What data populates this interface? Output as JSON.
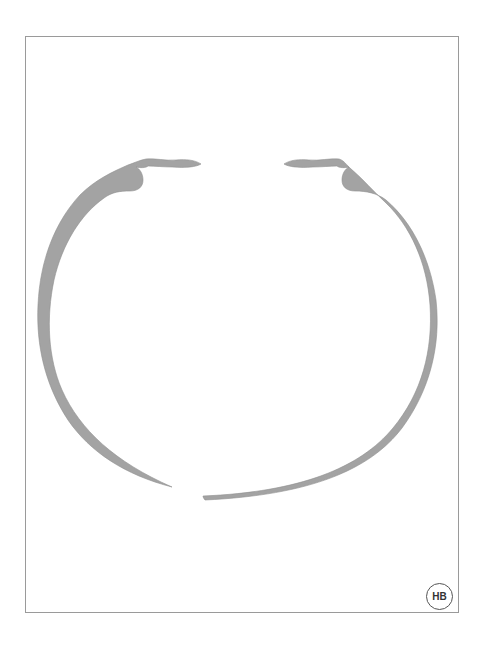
{
  "figure": {
    "badge_label": "HB",
    "fill_color": "#a3a3a3",
    "stroke_color": "#8a8a8a",
    "frame_color": "#9a9a9a"
  }
}
